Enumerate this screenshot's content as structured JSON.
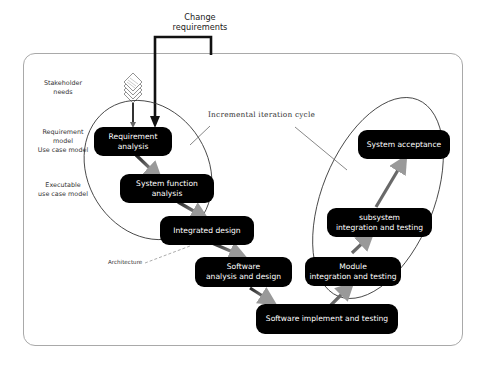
{
  "change_requirements": "Change\nrequirements",
  "cycle_label": "Incremental iteration cycle",
  "architecture_label": "Architecture",
  "side_labels": [
    {
      "text": "Stakeholder\nneeds"
    },
    {
      "text": "Requirement\nmodel\nUse case model"
    },
    {
      "text": "Executable\nuse case model"
    }
  ],
  "boxes": [
    {
      "id": "requirement-analysis",
      "label": "Requirement analysis"
    },
    {
      "id": "system-function-analysis",
      "label": "System function analysis"
    },
    {
      "id": "integrated-design",
      "label": "Integrated design"
    },
    {
      "id": "software-analysis-design",
      "label": "Software\nanalysis and design"
    },
    {
      "id": "software-implement-testing",
      "label": "Software implement and testing"
    },
    {
      "id": "module-integration-testing",
      "label": "Module\nintegration and testing"
    },
    {
      "id": "subsystem-integration-testing",
      "label": "subsystem\nintegration and testing"
    },
    {
      "id": "system-acceptance",
      "label": "System acceptance"
    }
  ],
  "colors": {
    "box_fill": "#000000",
    "box_text": "#ffffff",
    "frame_border": "#a9a9a9",
    "line": "#444444"
  }
}
